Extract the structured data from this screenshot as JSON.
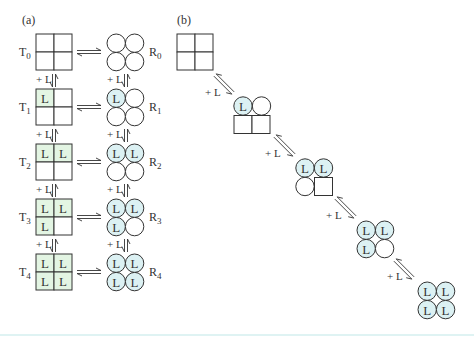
{
  "panels": {
    "a": {
      "label": "(a)"
    },
    "b": {
      "label": "(b)"
    }
  },
  "ligand_label": "L",
  "add_ligand_label": "+ L",
  "colors": {
    "t_filled": "#e3f5e3",
    "r_filled": "#dcf1f3",
    "stroke": "#333333",
    "bottom_line": "#dff3f3"
  },
  "panel_a": {
    "rows": [
      {
        "t_label": "T",
        "t_sub": "0",
        "r_label": "R",
        "r_sub": "0",
        "bound": 0
      },
      {
        "t_label": "T",
        "t_sub": "1",
        "r_label": "R",
        "r_sub": "1",
        "bound": 1
      },
      {
        "t_label": "T",
        "t_sub": "2",
        "r_label": "R",
        "r_sub": "2",
        "bound": 2
      },
      {
        "t_label": "T",
        "t_sub": "3",
        "r_label": "R",
        "r_sub": "3",
        "bound": 3
      },
      {
        "t_label": "T",
        "t_sub": "4",
        "r_label": "R",
        "r_sub": "4",
        "bound": 4
      }
    ]
  },
  "panel_b": {
    "steps": [
      {
        "bound": 0,
        "desc": "all-T square"
      },
      {
        "bound": 1,
        "desc": "top pair R, one ligand"
      },
      {
        "bound": 2,
        "desc": "three R one T, two ligands"
      },
      {
        "bound": 3,
        "desc": "all R, three ligands"
      },
      {
        "bound": 4,
        "desc": "all R, four ligands"
      }
    ]
  }
}
